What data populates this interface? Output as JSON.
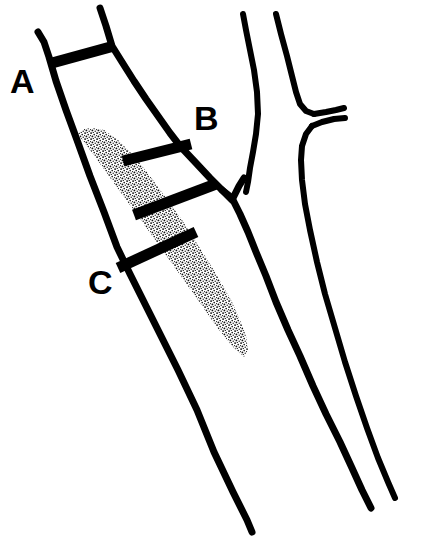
{
  "figure": {
    "name": "carotid-artery-plaque-measurement-diagram",
    "background_color": "#ffffff",
    "ink_color": "#000000",
    "width": 444,
    "height": 550
  },
  "labels": [
    {
      "id": "A",
      "text": "A",
      "x": 10,
      "y": 93,
      "description": "proximal measurement level marker"
    },
    {
      "id": "B",
      "text": "B",
      "x": 194,
      "y": 130,
      "description": "distal measurement level marker"
    },
    {
      "id": "C",
      "text": "C",
      "x": 88,
      "y": 294,
      "description": "plaque measurement level marker"
    }
  ],
  "measure_bars": [
    {
      "id": "bar-a",
      "label": "A",
      "x1": 52,
      "y1": 63,
      "x2": 114,
      "y2": 46,
      "thickness": 11
    },
    {
      "id": "bar-b-upper",
      "label": "B",
      "x1": 123,
      "y1": 161,
      "x2": 191,
      "y2": 144,
      "thickness": 11
    },
    {
      "id": "bar-b-lower",
      "label": "B",
      "x1": 134,
      "y1": 215,
      "x2": 216,
      "y2": 184,
      "thickness": 11
    },
    {
      "id": "bar-c",
      "label": "C",
      "x1": 118,
      "y1": 268,
      "x2": 196,
      "y2": 232,
      "thickness": 11
    }
  ],
  "vessel_paths": [
    {
      "id": "left-vessel-lateral-wall",
      "description": "lateral (left) wall of the internal carotid segment running from top-left down to the bottom",
      "stroke_width": 7,
      "points": "38,32 44,42 49,57 56,81 66,110 77,140 90,176 104,212 117,247 130,274 147,308 163,340 178,370 197,410 214,452 233,492 247,520 252,532"
    },
    {
      "id": "left-vessel-medial-wall",
      "description": "medial (right) wall of the internal carotid segment from top down to the bifurcation notch",
      "stroke_width": 7,
      "points": "100,8 106,26 112,46 122,62 134,81 146,99 158,116 170,133 180,146 196,163 210,178 222,190 232,198"
    },
    {
      "id": "lower-vessel-right-wall",
      "description": "continuation of the vessel wall below the plaque down to bottom-right",
      "stroke_width": 7,
      "points": "232,198 240,214 248,232 256,252 266,276 276,302 288,330 300,356 313,386 326,414 340,442 352,468 362,490 371,508"
    },
    {
      "id": "bifurcation-notch",
      "description": "V-shaped notch at the carotid bifurcation",
      "stroke_width": 7,
      "points": "222,190 232,200 239,186 244,178"
    },
    {
      "id": "external-carotid-lateral-wall",
      "description": "outer wall of the external carotid / adjacent vessel on the right, top segment",
      "stroke_width": 6,
      "points": "243,14 246,30 250,50 254,70 257,92 258,114 256,134 253,152 250,168 248,182 246,192"
    },
    {
      "id": "external-carotid-medial-wall",
      "description": "inner wall of the right-hand vessel descending to the small side branch",
      "stroke_width": 6,
      "points": "276,14 281,34 287,56 292,76 296,92 300,104 306,111 314,114"
    },
    {
      "id": "side-branch-upper-lip",
      "description": "upper edge of the small side branch stub",
      "stroke_width": 6,
      "points": "314,114 326,112 336,110 344,108"
    },
    {
      "id": "side-branch-lower-lip",
      "description": "lower edge of the small side branch stub",
      "stroke_width": 6,
      "points": "345,118 334,119 322,122 312,126"
    },
    {
      "id": "right-vessel-descending-wall",
      "description": "right-hand vessel wall continuing downward past the branch",
      "stroke_width": 6,
      "points": "312,126 306,134 302,146 301,160 302,180 305,204 310,230 317,262 325,294 335,328 345,362 356,396 367,428 378,458 388,482 395,498"
    }
  ],
  "plaque": {
    "id": "atherosclerotic-plaque",
    "description": "stippled eccentric atherosclerotic plaque filling the vessel lumen",
    "fill_pattern": "stipple-dots",
    "dot_color": "#000000",
    "outline": "78,136 92,152 108,173 124,196 140,219 156,242 172,264 190,286 208,308 222,326 234,342 244,356 238,348 226,334 210,316 196,300 180,282 164,262 148,240 134,218 120,196 106,173 92,152",
    "polygon": "78,136 100,164 124,198 148,232 170,262 192,290 214,318 232,340 244,356 240,352 228,338 214,322 198,304 180,284 162,262 146,240 130,216 116,194 102,170 88,150"
  },
  "plaque_body": {
    "description": "filled stipple region of the plaque, as a closed polygon",
    "points": "78,134 96,158 116,186 138,216 158,244 178,272 198,300 216,326 232,346 244,357 248,350 246,336 240,320 232,302 222,284 210,264 196,242 182,220 166,198 150,176 134,156 118,140 104,130 92,128 84,129"
  }
}
